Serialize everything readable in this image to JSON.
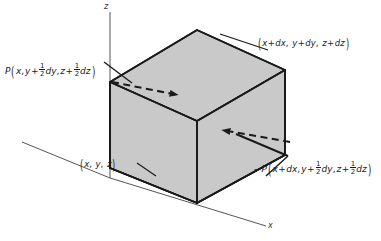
{
  "figure": {
    "type": "3d-cube-diagram",
    "width": 381,
    "height": 241,
    "background_color": "#ffffff",
    "line_color": "#1a1a1a",
    "shaded_face_color": "#c9c9c9",
    "axis_color": "#555555"
  },
  "axes": {
    "z_label": "z",
    "x_label": "x",
    "y_label": ""
  },
  "corner_labels": {
    "near_origin": {
      "text": "(x, y, z)",
      "open_paren": "(",
      "close_paren": ")",
      "v1": "x",
      "v2": "y",
      "v3": "z",
      "sep": ","
    },
    "far_corner": {
      "text": "(x + dx, y + dy, z + dz)",
      "open_paren": "(",
      "close_paren": ")",
      "t1_var": "x",
      "t1_op": "+",
      "t1_d": "dx",
      "t2_var": "y",
      "t2_op": "+",
      "t2_d": "dy",
      "t3_var": "z",
      "t3_op": "+",
      "t3_d": "dz",
      "sep": ","
    }
  },
  "force_labels": {
    "left": {
      "full_text": "P(x, y + 1/2 dy, z + 1/2 dz)",
      "symbol": "P",
      "sign": "",
      "open_paren": "(",
      "close_paren": ")",
      "arg1": "x",
      "arg2_var": "y",
      "arg2_op": "+",
      "arg2_num": "1",
      "arg2_den": "2",
      "arg2_d": "dy",
      "arg3_var": "z",
      "arg3_op": "+",
      "arg3_num": "1",
      "arg3_den": "2",
      "arg3_d": "dz",
      "sep": ","
    },
    "right": {
      "full_text": "-P(x + dx, y + 1/2 dy, z + 1/2 dz)",
      "symbol": "P",
      "sign": "−",
      "open_paren": "(",
      "close_paren": ")",
      "arg1_var": "x",
      "arg1_op": "+",
      "arg1_d": "dx",
      "arg2_var": "y",
      "arg2_op": "+",
      "arg2_num": "1",
      "arg2_den": "2",
      "arg2_d": "dy",
      "arg3_var": "z",
      "arg3_op": "+",
      "arg3_num": "1",
      "arg3_den": "2",
      "arg3_d": "dz",
      "sep": ","
    }
  },
  "arrows": {
    "left_arrow": {
      "direction": "right",
      "style": "dashed",
      "meaning": "pressure force on left face"
    },
    "right_arrow": {
      "direction": "left",
      "style": "dashed",
      "meaning": "pressure force on right face"
    }
  }
}
